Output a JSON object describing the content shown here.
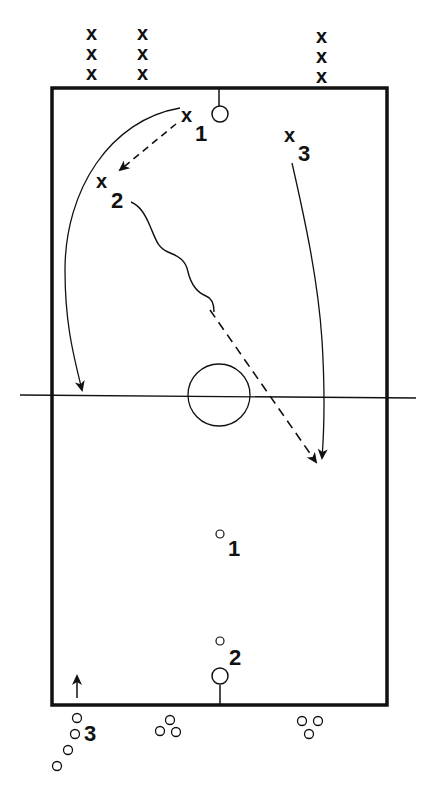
{
  "diagram": {
    "type": "sports-drill-court",
    "colors": {
      "ink": "#111111",
      "background": "#ffffff"
    },
    "court": {
      "left": 52,
      "top": 88,
      "right": 387,
      "bottom": 705
    },
    "waiting_lines_top": [
      {
        "x": 93,
        "marks": [
          "x",
          "x",
          "x"
        ]
      },
      {
        "x": 144,
        "marks": [
          "x",
          "x",
          "x"
        ]
      },
      {
        "x": 323,
        "marks": [
          "x",
          "x",
          "x"
        ]
      }
    ],
    "players": {
      "x1": {
        "mark": "x",
        "number": "1"
      },
      "x2": {
        "mark": "x",
        "number": "2"
      },
      "x3": {
        "mark": "x",
        "number": "3"
      }
    },
    "opponents": {
      "o1": {
        "number": "1"
      },
      "o2": {
        "number": "2"
      },
      "o3": {
        "number": "3"
      }
    },
    "legend": {
      "pass": "dashed arrow",
      "dribble": "wavy line",
      "run": "solid arrow"
    }
  }
}
